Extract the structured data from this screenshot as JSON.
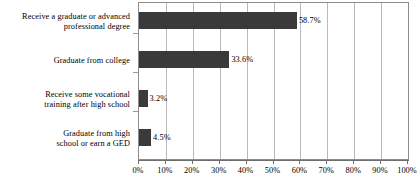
{
  "chart_data": {
    "type": "bar",
    "orientation": "horizontal",
    "title": "",
    "subtitle": "",
    "xlabel": "",
    "ylabel": "",
    "categories": [
      "Receive a graduate or advanced professional degree",
      "Graduate from college",
      "Receive some vocational training after high school",
      "Graduate from high school or earn a GED"
    ],
    "category_lines": [
      [
        "Receive a graduate or advanced",
        "professional degree"
      ],
      [
        "Graduate from college"
      ],
      [
        "Receive some vocational",
        "training after high school"
      ],
      [
        "Graduate from high",
        "school or earn a GED"
      ]
    ],
    "values": [
      58.7,
      33.6,
      3.2,
      4.5
    ],
    "value_labels": [
      "58.7%",
      "33.6%",
      "3.2%",
      "4.5%"
    ],
    "xlim": [
      0,
      100
    ],
    "xticks": [
      0,
      10,
      20,
      30,
      40,
      50,
      60,
      70,
      80,
      90,
      100
    ],
    "xtick_labels": [
      "0%",
      "10%",
      "20%",
      "30%",
      "40%",
      "50%",
      "60%",
      "70%",
      "80%",
      "90%",
      "100%"
    ],
    "grid": true,
    "grid_axis": "x",
    "legend": false,
    "bar_color": "#3a3a3a",
    "gridline_color": "#b9b9b9",
    "axis_color": "#8c8c8c",
    "background_color": "#ffffff"
  }
}
